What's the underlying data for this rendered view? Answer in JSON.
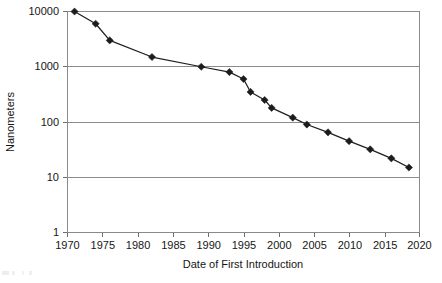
{
  "chart_data": {
    "type": "line",
    "title": "",
    "subtitle": "",
    "xlabel": "Date of First Introduction",
    "ylabel": "Nanometers",
    "yscale": "log",
    "xscale": "linear",
    "xlim": [
      1970,
      2020
    ],
    "ylim": [
      1,
      10000
    ],
    "xticks": [
      1970,
      1975,
      1980,
      1985,
      1990,
      1995,
      2000,
      2005,
      2010,
      2015,
      2020
    ],
    "xtick_labels": [
      "1970",
      "1975",
      "1980",
      "1985",
      "1990",
      "1995",
      "2000",
      "2005",
      "2010",
      "2015",
      "2020"
    ],
    "yticks": [
      1,
      10,
      100,
      1000,
      10000
    ],
    "ytick_labels": [
      "1",
      "10",
      "100",
      "1000",
      "10000"
    ],
    "grid": "horizontal",
    "legend": "none",
    "marker": "diamond",
    "marker_color": "#1c1c1c",
    "line_color": "#1f1f1f",
    "gridline_color": "#8c8c8c",
    "axis_color": "#8a8a8a",
    "series": [
      {
        "name": "Process node size",
        "x": [
          1971,
          1974,
          1976,
          1982,
          1989,
          1993,
          1995,
          1996,
          1998,
          1999,
          2002,
          2004,
          2007,
          2010,
          2013,
          2016,
          2018.5
        ],
        "y": [
          10000,
          6000,
          3000,
          1500,
          1000,
          800,
          600,
          350,
          250,
          180,
          120,
          90,
          65,
          45,
          32,
          22,
          15
        ]
      }
    ],
    "points": [
      {
        "x": 1971,
        "y": 10000
      },
      {
        "x": 1974,
        "y": 6000
      },
      {
        "x": 1976,
        "y": 3000
      },
      {
        "x": 1982,
        "y": 1500
      },
      {
        "x": 1989,
        "y": 1000
      },
      {
        "x": 1993,
        "y": 800
      },
      {
        "x": 1995,
        "y": 600
      },
      {
        "x": 1996,
        "y": 350
      },
      {
        "x": 1998,
        "y": 250
      },
      {
        "x": 1999,
        "y": 180
      },
      {
        "x": 2002,
        "y": 120
      },
      {
        "x": 2004,
        "y": 90
      },
      {
        "x": 2007,
        "y": 65
      },
      {
        "x": 2010,
        "y": 45
      },
      {
        "x": 2013,
        "y": 32
      },
      {
        "x": 2016,
        "y": 22
      },
      {
        "x": 2018.5,
        "y": 15
      }
    ]
  }
}
